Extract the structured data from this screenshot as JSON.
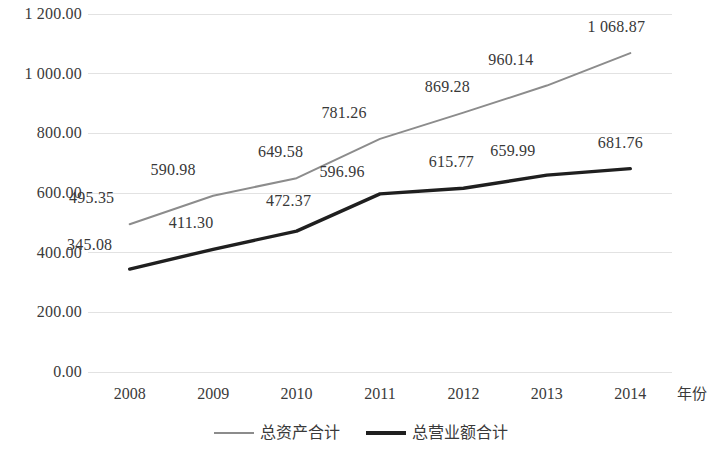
{
  "chart_data": {
    "type": "line",
    "title": "",
    "xlabel": "年份",
    "ylabel": "",
    "x": [
      "2008",
      "2009",
      "2010",
      "2011",
      "2012",
      "2013",
      "2014"
    ],
    "categories": [
      "2008",
      "2009",
      "2010",
      "2011",
      "2012",
      "2013",
      "2014"
    ],
    "ylim": [
      0,
      1200
    ],
    "yticks": [
      "0.00",
      "200.00",
      "400.00",
      "600.00",
      "800.00",
      "1 000.00",
      "1 200.00"
    ],
    "ytick_values": [
      0,
      200,
      400,
      600,
      800,
      1000,
      1200
    ],
    "grid": true,
    "legend_position": "bottom",
    "series": [
      {
        "name": "总资产合计",
        "color": "#8c8c8c",
        "values": [
          495.35,
          590.98,
          649.58,
          781.26,
          869.28,
          960.14,
          1068.87
        ],
        "labels": [
          "495.35",
          "590.98",
          "649.58",
          "781.26",
          "869.28",
          "960.14",
          "1 068.87"
        ]
      },
      {
        "name": "总营业额合计",
        "color": "#1f1f1f",
        "values": [
          345.08,
          411.3,
          472.37,
          596.96,
          615.77,
          659.99,
          681.76
        ],
        "labels": [
          "345.08",
          "411.30",
          "472.37",
          "596.96",
          "615.77",
          "659.99",
          "681.76"
        ]
      }
    ]
  },
  "legend": {
    "items": [
      {
        "label": "总资产合计"
      },
      {
        "label": "总营业额合计"
      }
    ]
  },
  "axes": {
    "x_axis_title": "年份"
  }
}
